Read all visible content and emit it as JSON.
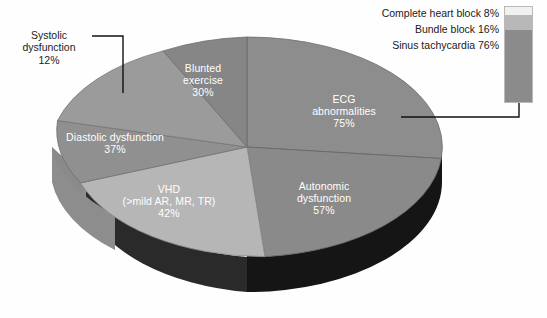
{
  "chart_data": {
    "type": "pie",
    "title": "",
    "subtitle": "",
    "xlabel": "",
    "ylabel": "",
    "legend_position": "top-right",
    "grid": false,
    "note": "3-D exploded-style pie of cardiac abnormality prevalences; each wedge is labelled with its own percentage (percentages are independent prevalences and do not sum to 100).",
    "categories": [
      "ECG abnormalities",
      "Autonomic dysfunction",
      "VHD (>mild AR, MR, TR)",
      "Diastolic dysfunction",
      "Blunted exercise",
      "Systolic dysfunction"
    ],
    "values": [
      75,
      57,
      42,
      37,
      30,
      12
    ],
    "slices": [
      {
        "name": "ecg-abnormalities",
        "label": "ECG\nabnormalities\n75%",
        "value": 75,
        "value_text": "75%",
        "top_color": "#8d8d8d",
        "side_color": "#1a1a1a",
        "start_deg": 0,
        "end_deg": 96
      },
      {
        "name": "autonomic-dysfunction",
        "label": "Autonomic\ndysfunction\n57%",
        "value": 57,
        "value_text": "57%",
        "top_color": "#8a8a8a",
        "side_color": "#262626",
        "start_deg": 96,
        "end_deg": 169
      },
      {
        "name": "vhd",
        "label": "VHD\n(>mild AR, MR, TR)\n42%",
        "value": 42,
        "value_text": "42%",
        "top_color": "#b4b4b4",
        "side_color": "#8f8f8f",
        "start_deg": 169,
        "end_deg": 223
      },
      {
        "name": "diastolic-dysfunction",
        "label": "Diastolic dysfunction\n37%",
        "value": 37,
        "value_text": "37%",
        "top_color": "#8e8e8e",
        "side_color": "#707070",
        "start_deg": 223,
        "end_deg": 270
      },
      {
        "name": "blunted-exercise",
        "label": "Blunted\nexercise\n30%",
        "value": 30,
        "value_text": "30%",
        "top_color": "#9a9a9a",
        "side_color": "#7c7c7c",
        "start_deg": 270,
        "end_deg": 345
      },
      {
        "name": "systolic-dysfunction",
        "label": "Systolic\ndysfunction\n12%",
        "value": 12,
        "value_text": "12%",
        "top_color": "#848484",
        "side_color": "#6a6a6a",
        "start_deg": 345,
        "end_deg": 360,
        "leader_line": true
      }
    ],
    "inset_bar": {
      "type": "bar",
      "orientation": "vertical-stacked",
      "parent_slice": "ECG abnormalities 75%",
      "categories": [
        "Complete heart block",
        "Bundle block",
        "Sinus tachycardia"
      ],
      "values": [
        8,
        16,
        76
      ],
      "entries": [
        {
          "label": "Complete heart block 8%",
          "name": "complete-heart-block",
          "value": 8,
          "value_text": "8%",
          "color": "#f1f1f1"
        },
        {
          "label": "Bundle block 16%",
          "name": "bundle-block",
          "value": 16,
          "value_text": "16%",
          "color": "#b8b8b8"
        },
        {
          "label": "Sinus tachycardia 76%",
          "name": "sinus-tachycardia",
          "value": 76,
          "value_text": "76%",
          "color": "#8b8b8b"
        }
      ]
    }
  },
  "legend": {
    "items": [
      "Complete heart block 8%",
      "Bundle block 16%",
      "Sinus tachycardia 76%"
    ]
  },
  "labels": {
    "systolic": "Systolic\ndysfunction\n12%",
    "blunted": "Blunted\nexercise\n30%",
    "ecg": "ECG\nabnormalities\n75%",
    "diastolic": "Diastolic dysfunction\n37%",
    "vhd": "VHD\n(>mild AR, MR, TR)\n42%",
    "autonomic": "Autonomic\ndysfunction\n57%"
  },
  "colors": {
    "background": "#fefefe",
    "text": "#1a1a1a",
    "label_text": "#ffffff",
    "leader_line": "#101010",
    "connector_line": "#101010"
  }
}
